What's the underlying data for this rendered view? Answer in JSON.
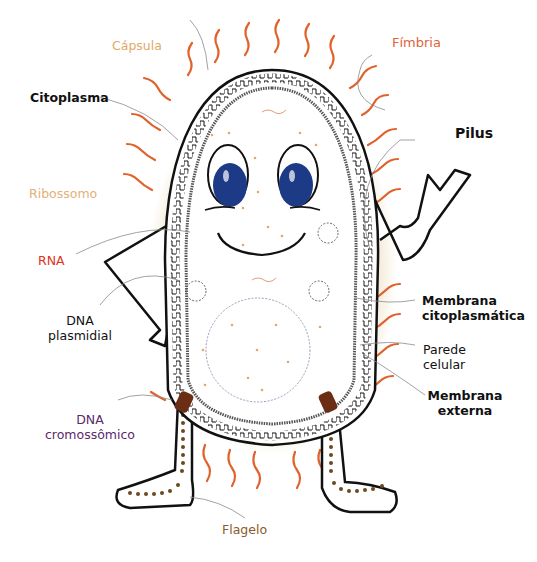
{
  "diagram": {
    "colors": {
      "outline": "#111111",
      "capsule_glow": "#d8b870",
      "fimbria": "#e0622a",
      "eye_iris": "#1c3a86",
      "flagellum_base": "#6b2e14",
      "flagellum_dots": "#6b4a22",
      "pointer_line": "#8a8a8a"
    },
    "labels": {
      "capsula": {
        "text": "Cápsula",
        "color": "#e3a86a"
      },
      "fimbria": {
        "text": "Fímbria",
        "color": "#e0643a"
      },
      "citoplasma": {
        "text": "Citoplasma",
        "color": "#111111"
      },
      "pilus": {
        "text": "Pilus",
        "color": "#111111"
      },
      "ribossomo": {
        "text": "Ribossomo",
        "color": "#e3b07a"
      },
      "rna": {
        "text": "RNA",
        "color": "#e0321c"
      },
      "dna_plasmidial": {
        "line1": "DNA",
        "line2": "plasmidial",
        "color": "#111111"
      },
      "membrana_citoplasmatica": {
        "line1": "Membrana",
        "line2": "citoplasmática",
        "color": "#111111"
      },
      "parede_celular": {
        "line1": "Parede",
        "line2": "celular",
        "color": "#111111"
      },
      "membrana_externa": {
        "line1": "Membrana",
        "line2": "externa",
        "color": "#111111"
      },
      "dna_cromossomico": {
        "line1": "DNA",
        "line2": "cromossômico",
        "color": "#5a2a6a"
      },
      "flagelo": {
        "text": "Flagelo",
        "color": "#8a5a2a"
      }
    }
  }
}
